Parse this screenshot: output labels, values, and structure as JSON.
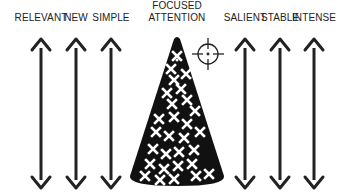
{
  "diagram": {
    "colors": {
      "ink": "#222222",
      "cone_fill": "#111111",
      "cross_fill": "#ffffff",
      "background": "#ffffff"
    },
    "left_labels": [
      {
        "text": "RELEVANT",
        "x": 41
      },
      {
        "text": "NEW",
        "x": 76
      },
      {
        "text": "SIMPLE",
        "x": 111
      }
    ],
    "center_label": {
      "line1": "FOCUSED",
      "line2": "ATTENTION",
      "x": 177
    },
    "right_labels": [
      {
        "text": "SALIENT",
        "x": 245
      },
      {
        "text": "STABLE",
        "x": 280
      },
      {
        "text": "INTENSE",
        "x": 314
      }
    ],
    "arrows": {
      "type": "double-headed vertical",
      "top_y": 38,
      "bottom_y": 188
    },
    "cone": {
      "apex": [
        177,
        37
      ],
      "base_left": 130,
      "base_right": 224,
      "base_y": 180,
      "cross_count": 28
    },
    "crosshair": {
      "cx": 208,
      "cy": 54,
      "r": 10
    }
  }
}
